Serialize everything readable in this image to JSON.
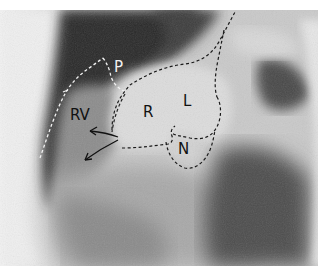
{
  "image": {
    "type": "radiograph",
    "description": "Lateral angiographic view of the heart with dashed outlines of aortic root sinuses and right ventricle outflow",
    "colors": {
      "background": "#ffffff",
      "film_light": "#d8d8d8",
      "film_mid": "#9a9a9a",
      "film_dark": "#3a3a3a",
      "outline_light": "#f2f2f2",
      "outline_dark": "#1a1a1a"
    }
  },
  "labels": {
    "rv": "RV",
    "p": "P",
    "r": "R",
    "l": "L",
    "n": "N"
  }
}
